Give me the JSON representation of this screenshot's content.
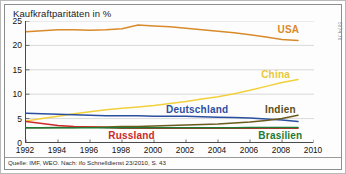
{
  "figure": {
    "title": "Kaufkraftparitäten in %",
    "source_note": "Quelle: IMF, WEO. Nach: ifo Schnelldienst 23/2010, S. 43",
    "side_code": "5874.76"
  },
  "chart_data": {
    "type": "line",
    "title": "Kaufkraftparitäten in %",
    "xlabel": "",
    "ylabel": "%",
    "xlim": [
      1992,
      2010
    ],
    "ylim": [
      0,
      25
    ],
    "grid": true,
    "grid_axis": "y",
    "legend": "inline-labels",
    "x_ticks": [
      1992,
      1994,
      1996,
      1998,
      2000,
      2002,
      2004,
      2006,
      2008,
      2010
    ],
    "y_ticks": [
      0,
      5,
      10,
      15,
      20,
      25
    ],
    "x": [
      1992,
      1993,
      1994,
      1995,
      1996,
      1997,
      1998,
      1999,
      2000,
      2001,
      2002,
      2003,
      2004,
      2005,
      2006,
      2007,
      2008,
      2009
    ],
    "series": [
      {
        "name": "USA",
        "color": "#D98A2B",
        "label_color": "#D98A2B",
        "values": [
          22.8,
          23.0,
          23.2,
          23.2,
          23.1,
          23.2,
          23.4,
          24.2,
          24.0,
          23.8,
          23.5,
          23.2,
          22.9,
          22.6,
          22.2,
          21.7,
          21.2,
          21.0
        ]
      },
      {
        "name": "China",
        "color": "#F2D03C",
        "label_color": "#E8C83A",
        "values": [
          4.5,
          5.0,
          5.5,
          6.0,
          6.4,
          6.8,
          7.1,
          7.4,
          7.7,
          8.1,
          8.5,
          9.0,
          9.5,
          10.1,
          10.8,
          11.6,
          12.4,
          13.0
        ]
      },
      {
        "name": "Deutschland",
        "color": "#2B4FA0",
        "label_color": "#2B4FA0",
        "values": [
          6.1,
          6.0,
          5.9,
          5.8,
          5.7,
          5.6,
          5.6,
          5.6,
          5.5,
          5.5,
          5.5,
          5.4,
          5.3,
          5.2,
          5.1,
          4.9,
          4.7,
          4.4
        ]
      },
      {
        "name": "Indien",
        "color": "#6B5A1E",
        "label_color": "#5C4E1A",
        "values": [
          3.1,
          3.1,
          3.2,
          3.2,
          3.3,
          3.3,
          3.4,
          3.4,
          3.5,
          3.6,
          3.7,
          3.8,
          3.9,
          4.1,
          4.3,
          4.6,
          5.0,
          5.7
        ]
      },
      {
        "name": "Russland",
        "color": "#CC2A2A",
        "label_color": "#CC2A2A",
        "values": [
          4.4,
          4.0,
          3.6,
          3.4,
          3.3,
          3.2,
          3.0,
          3.0,
          3.0,
          3.0,
          3.0,
          3.0,
          3.0,
          3.0,
          3.0,
          3.0,
          3.0,
          3.0
        ]
      },
      {
        "name": "Brasilien",
        "color": "#1E7A34",
        "label_color": "#1E7A34",
        "values": [
          3.1,
          3.1,
          3.1,
          3.1,
          3.1,
          3.1,
          3.1,
          3.1,
          3.1,
          3.1,
          3.1,
          3.1,
          3.1,
          3.1,
          3.2,
          3.2,
          3.2,
          3.2
        ]
      }
    ],
    "annotations": [
      {
        "text": "USA",
        "x": 2008.4,
        "y": 23.3,
        "color": "#D98A2B"
      },
      {
        "text": "China",
        "x": 2007.6,
        "y": 14.2,
        "color": "#E8C83A"
      },
      {
        "text": "Deutschland",
        "x": 2002.7,
        "y": 6.9,
        "color": "#2B4FA0"
      },
      {
        "text": "Indien",
        "x": 2007.9,
        "y": 6.9,
        "color": "#5C4E1A"
      },
      {
        "text": "Russland",
        "x": 1998.6,
        "y": 1.6,
        "color": "#CC2A2A"
      },
      {
        "text": "Brasilien",
        "x": 2007.9,
        "y": 1.6,
        "color": "#1E7A34"
      }
    ]
  }
}
